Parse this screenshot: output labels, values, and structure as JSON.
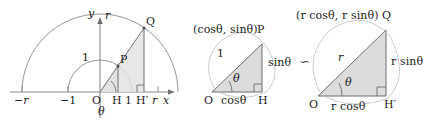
{
  "figure": {
    "type": "geometry-diagram",
    "similarity_symbol": "∽"
  },
  "panel_left": {
    "axis_y_label": "y",
    "axis_y_radius_label": "r",
    "axis_x_label": "x",
    "axis_x_radius_label": "r",
    "tick_neg_r": "−r",
    "tick_neg_1": "−1",
    "tick_one": "1",
    "origin_label": "O",
    "point_p": "P",
    "point_q": "Q",
    "foot_h": "H",
    "foot_h_prime": "H′",
    "radius_one_label": "1",
    "angle_label": "θ"
  },
  "panel_middle": {
    "vertex_coords": "(cosθ, sinθ)",
    "vertex_name": "P",
    "origin_label": "O",
    "foot_label": "H",
    "hypotenuse_label": "1",
    "opposite_label": "sinθ",
    "adjacent_label": "cosθ",
    "angle_label": "θ"
  },
  "panel_right": {
    "vertex_coords": "(r cosθ, r sinθ)",
    "vertex_name": "Q",
    "origin_label": "O",
    "foot_label": "H′",
    "hypotenuse_label": "r",
    "opposite_label": "r sinθ",
    "adjacent_label": "r cosθ",
    "angle_label": "θ"
  },
  "colors": {
    "stroke": "#6e6e76",
    "axis": "#8a8a90",
    "fill": "#dcdcdc",
    "text": "#1a1a1a"
  }
}
